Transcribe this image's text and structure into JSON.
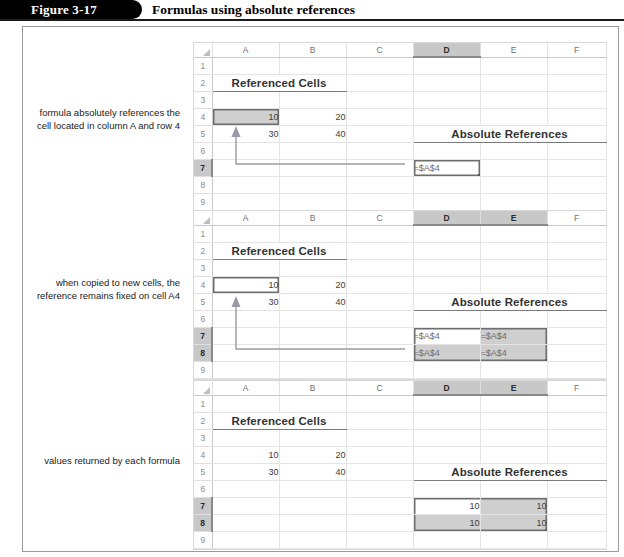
{
  "figure": {
    "number_label": "Figure 3-17",
    "title": "Formulas using absolute references"
  },
  "captions": {
    "panel1": "formula absolutely references the cell located in column A and row 4",
    "panel2": "when copied to new cells, the reference remains fixed on cell A4",
    "panel3": "values returned by each formula"
  },
  "colors": {
    "header_bar": "#000000",
    "selection_gray": "#c8c8c8",
    "range_shade": "#cfcfcf",
    "range_border": "#6e6e6e",
    "gridline": "#e4e4e4",
    "arrow": "#8a8a9a"
  },
  "spreadsheet": {
    "column_headers": [
      "A",
      "B",
      "C",
      "D",
      "E",
      "F"
    ],
    "row_headers": [
      "1",
      "2",
      "3",
      "4",
      "5",
      "6",
      "7",
      "8",
      "9"
    ],
    "labels": {
      "referenced_cells": "Referenced Cells",
      "absolute_references": "Absolute References"
    }
  },
  "panels": [
    {
      "id": "panel-1",
      "selected_columns": [
        "D"
      ],
      "selected_rows": [
        "7"
      ],
      "values": {
        "A4": "10",
        "B4": "20",
        "A5": "30",
        "B5": "40",
        "D7": "=$A$4"
      },
      "source_cell": "A4",
      "formula_cells": [
        "D7"
      ]
    },
    {
      "id": "panel-2",
      "selected_columns": [
        "D",
        "E"
      ],
      "selected_rows": [
        "7",
        "8"
      ],
      "values": {
        "A4": "10",
        "B4": "20",
        "A5": "30",
        "B5": "40",
        "D7": "=$A$4",
        "E7": "=$A$4",
        "D8": "=$A$4",
        "E8": "=$A$4"
      },
      "source_cell": "A4",
      "formula_cells": [
        "D7",
        "E7",
        "D8",
        "E8"
      ]
    },
    {
      "id": "panel-3",
      "selected_columns": [
        "D",
        "E"
      ],
      "selected_rows": [
        "7",
        "8"
      ],
      "values": {
        "A4": "10",
        "B4": "20",
        "A5": "30",
        "B5": "40",
        "D7": "10",
        "E7": "10",
        "D8": "10",
        "E8": "10"
      },
      "source_cell": null,
      "formula_cells": [
        "D7",
        "E7",
        "D8",
        "E8"
      ]
    }
  ]
}
